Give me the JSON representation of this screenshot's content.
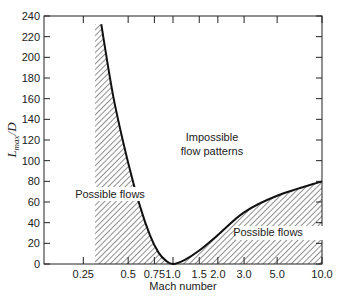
{
  "chart_data": {
    "type": "line",
    "title": "",
    "xlabel": "Mach number",
    "ylabel": "L_max/D",
    "ylabel_main": "L",
    "ylabel_sub": "max",
    "ylabel_tail": "/D",
    "xscale": "log",
    "xlim": [
      0.17,
      10.0
    ],
    "ylim": [
      0,
      240
    ],
    "x_ticks": [
      0.25,
      0.5,
      0.75,
      1.0,
      1.5,
      2.0,
      3.0,
      5.0,
      10.0
    ],
    "x_tick_labels": [
      "0.25",
      "0.5",
      "0.75",
      "1.0",
      "1.5",
      "2.0",
      "3.0",
      "5.0",
      "10.0"
    ],
    "y_ticks": [
      0,
      20,
      40,
      60,
      80,
      100,
      120,
      140,
      160,
      180,
      200,
      220,
      240
    ],
    "y_tick_labels": [
      "0",
      "20",
      "40",
      "60",
      "80",
      "100",
      "120",
      "140",
      "160",
      "180",
      "200",
      "220",
      "240"
    ],
    "grid": false,
    "series": [
      {
        "name": "L_max/D limit curve",
        "x": [
          0.33,
          0.4,
          0.5,
          0.6,
          0.7,
          0.8,
          0.9,
          1.0,
          1.2,
          1.5,
          2.0,
          3.0,
          5.0,
          10.0
        ],
        "values": [
          232,
          160,
          98,
          56,
          28,
          11,
          3,
          0,
          4,
          13,
          28,
          50,
          66,
          80
        ]
      }
    ],
    "shaded_regions": [
      {
        "label": "Possible flows",
        "x_range": [
          0.3,
          1.0
        ],
        "description": "hatched region left of subsonic branch"
      },
      {
        "label": "Possible flows",
        "x_range": [
          1.0,
          10.0
        ],
        "description": "hatched region below supersonic branch"
      }
    ],
    "annotations": [
      {
        "text": "Impossible flow patterns",
        "x": 1.6,
        "y": 125
      },
      {
        "text": "Possible flows",
        "x": 0.38,
        "y": 68
      },
      {
        "text": "Possible flows",
        "x": 4.5,
        "y": 25
      }
    ]
  },
  "labels": {
    "impossible_line1": "Impossible",
    "impossible_line2": "flow patterns",
    "possible_left": "Possible flows",
    "possible_right": "Possible flows",
    "xlabel": "Mach number"
  }
}
